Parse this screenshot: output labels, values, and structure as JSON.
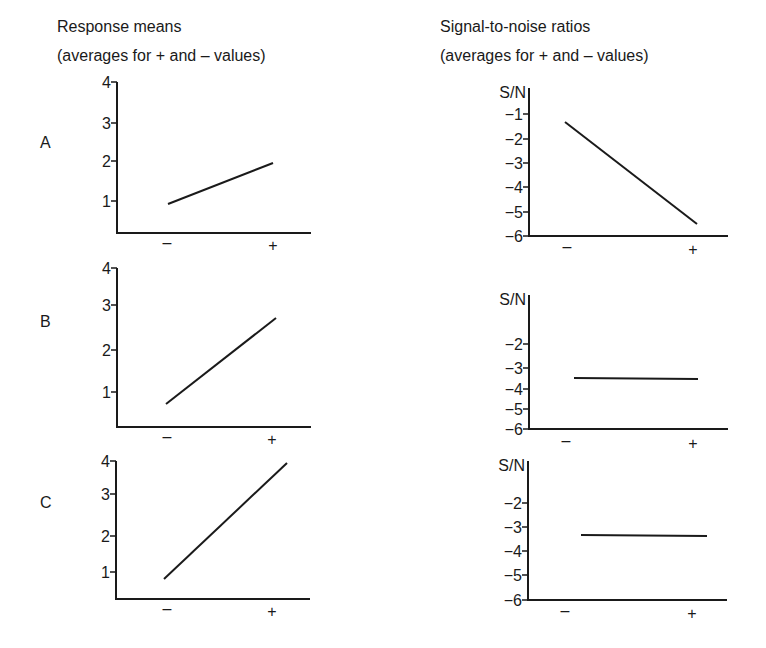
{
  "titles": {
    "left": {
      "line1": "Response means",
      "line2": "(averages for + and – values)"
    },
    "right": {
      "line1": "Signal-to-noise ratios",
      "line2": "(averages for + and – values)"
    }
  },
  "row_labels": [
    "A",
    "B",
    "C"
  ],
  "x_tick_labels": [
    "–",
    "+"
  ],
  "chart_data": [
    {
      "type": "line",
      "row": "A",
      "column": "Response means",
      "title": "Response means (averages for + and – values)",
      "categories": [
        "–",
        "+"
      ],
      "values": [
        0.9,
        1.95
      ],
      "ylabel": "",
      "yticks": [
        "1",
        "2",
        "3",
        "4"
      ],
      "ylim": [
        0,
        4
      ],
      "grid": false
    },
    {
      "type": "line",
      "row": "A",
      "column": "Signal-to-noise ratios",
      "title": "Signal-to-noise ratios (averages for + and – values)",
      "categories": [
        "–",
        "+"
      ],
      "values": [
        -1.3,
        -5.5
      ],
      "ylabel": "S/N",
      "yticks": [
        "−1",
        "−2",
        "−3",
        "−4",
        "−5",
        "−6"
      ],
      "ylim": [
        -6,
        -0.3
      ],
      "grid": false
    },
    {
      "type": "line",
      "row": "B",
      "column": "Response means",
      "categories": [
        "–",
        "+"
      ],
      "values": [
        0.7,
        2.75
      ],
      "ylabel": "",
      "yticks": [
        "1",
        "2",
        "3",
        "4"
      ],
      "ylim": [
        0,
        4
      ],
      "grid": false
    },
    {
      "type": "line",
      "row": "B",
      "column": "Signal-to-noise ratios",
      "categories": [
        "–",
        "+"
      ],
      "values": [
        -3.45,
        -3.45
      ],
      "ylabel": "S/N",
      "yticks": [
        "−2",
        "−3",
        "−4",
        "−5",
        "−6"
      ],
      "ylim": [
        -6,
        -0.3
      ],
      "grid": false
    },
    {
      "type": "line",
      "row": "C",
      "column": "Response means",
      "categories": [
        "–",
        "+"
      ],
      "values": [
        0.8,
        3.95
      ],
      "ylabel": "",
      "yticks": [
        "1",
        "2",
        "3",
        "4"
      ],
      "ylim": [
        0,
        4
      ],
      "grid": false
    },
    {
      "type": "line",
      "row": "C",
      "column": "Signal-to-noise ratios",
      "categories": [
        "–",
        "+"
      ],
      "values": [
        -3.3,
        -3.3
      ],
      "ylabel": "S/N",
      "yticks": [
        "−2",
        "−3",
        "−4",
        "−5",
        "−6"
      ],
      "ylim": [
        -6,
        -0.3
      ],
      "grid": false
    }
  ],
  "layout": {
    "panels": [
      {
        "ax": 117,
        "ay0": 233,
        "axEnd": 311,
        "yTop": 82,
        "ticks": [
          {
            "label": "1",
            "y": 201
          },
          {
            "label": "2",
            "y": 161
          },
          {
            "label": "3",
            "y": 123
          },
          {
            "label": "4",
            "y": 82
          }
        ],
        "line": [
          [
            168,
            204
          ],
          [
            273,
            163
          ]
        ],
        "xm": 167,
        "xp": 273,
        "xly": 248,
        "sn": false
      },
      {
        "ax": 529,
        "ay0": 236,
        "axEnd": 728,
        "yTop": 90,
        "ticks": [
          {
            "label": "−1",
            "y": 114
          },
          {
            "label": "−2",
            "y": 139
          },
          {
            "label": "−3",
            "y": 163
          },
          {
            "label": "−4",
            "y": 187
          },
          {
            "label": "−5",
            "y": 212
          },
          {
            "label": "−6",
            "y": 236
          }
        ],
        "line": [
          [
            565,
            122
          ],
          [
            697,
            224
          ]
        ],
        "xm": 567,
        "xp": 693,
        "xly": 252,
        "sn": true
      },
      {
        "ax": 117,
        "ay0": 427,
        "axEnd": 311,
        "yTop": 268,
        "ticks": [
          {
            "label": "1",
            "y": 392
          },
          {
            "label": "2",
            "y": 350
          },
          {
            "label": "3",
            "y": 305
          },
          {
            "label": "4",
            "y": 268
          }
        ],
        "line": [
          [
            166,
            404
          ],
          [
            276,
            318
          ]
        ],
        "xm": 167,
        "xp": 272,
        "xly": 442,
        "sn": false
      },
      {
        "ax": 529,
        "ay0": 429,
        "axEnd": 728,
        "yTop": 297,
        "ticks": [
          {
            "label": "−2",
            "y": 344
          },
          {
            "label": "−3",
            "y": 368
          },
          {
            "label": "−4",
            "y": 389
          },
          {
            "label": "−5",
            "y": 409
          },
          {
            "label": "−6",
            "y": 429
          }
        ],
        "line": [
          [
            574,
            378
          ],
          [
            698,
            379
          ]
        ],
        "xm": 566,
        "xp": 693,
        "xly": 446,
        "sn": true
      },
      {
        "ax": 116,
        "ay0": 599,
        "axEnd": 310,
        "yTop": 461,
        "ticks": [
          {
            "label": "1",
            "y": 572
          },
          {
            "label": "2",
            "y": 536
          },
          {
            "label": "3",
            "y": 494
          },
          {
            "label": "4",
            "y": 461
          }
        ],
        "line": [
          [
            164,
            579
          ],
          [
            287,
            463
          ]
        ],
        "xm": 167,
        "xp": 272,
        "xly": 614,
        "sn": false
      },
      {
        "ax": 528,
        "ay0": 600,
        "axEnd": 727,
        "yTop": 463,
        "ticks": [
          {
            "label": "−2",
            "y": 503
          },
          {
            "label": "−3",
            "y": 527
          },
          {
            "label": "−4",
            "y": 551
          },
          {
            "label": "−5",
            "y": 575
          },
          {
            "label": "−6",
            "y": 600
          }
        ],
        "line": [
          [
            581,
            535
          ],
          [
            707,
            536
          ]
        ],
        "xm": 565,
        "xp": 692,
        "xly": 616,
        "sn": true
      }
    ]
  }
}
